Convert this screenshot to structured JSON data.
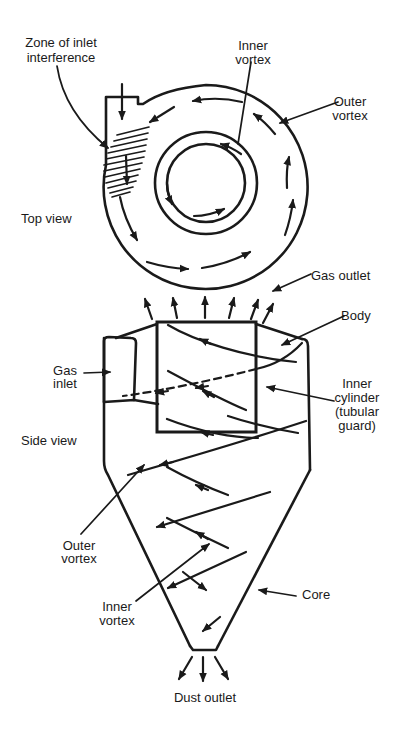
{
  "colors": {
    "ink": "#1a1a1a",
    "background": "#ffffff"
  },
  "top_view": {
    "caption": "Top view",
    "labels": {
      "zone_of_inlet_interference": {
        "lines": [
          "Zone of inlet",
          "interference"
        ]
      },
      "inner_vortex": {
        "lines": [
          "Inner",
          "vortex"
        ]
      },
      "outer_vortex": {
        "lines": [
          "Outer",
          "vortex"
        ]
      }
    }
  },
  "side_view": {
    "caption": "Side view",
    "labels": {
      "gas_outlet": "Gas outlet",
      "body": "Body",
      "gas_inlet": {
        "lines": [
          "Gas",
          "inlet"
        ]
      },
      "inner_cylinder": {
        "lines": [
          "Inner",
          "cylinder",
          "(tubular",
          "guard)"
        ]
      },
      "outer_vortex": {
        "lines": [
          "Outer",
          "vortex"
        ]
      },
      "inner_vortex": {
        "lines": [
          "Inner",
          "vortex"
        ]
      },
      "core": "Core",
      "dust_outlet": "Dust outlet"
    }
  }
}
